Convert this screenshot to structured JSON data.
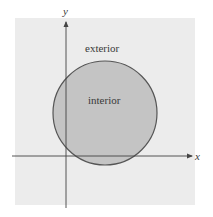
{
  "diagram": {
    "type": "set-region illustration",
    "axes": {
      "x_label": "x",
      "y_label": "y"
    },
    "regions": {
      "exterior_label": "exterior",
      "interior_label": "interior"
    },
    "colors": {
      "background_region": "#ececec",
      "circle_fill": "#c4c4c4",
      "circle_stroke": "#555555",
      "axis": "#444444"
    }
  }
}
